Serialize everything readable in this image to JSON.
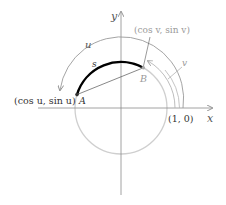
{
  "diagram": {
    "axes": {
      "x_label": "x",
      "y_label": "y",
      "unit_point_label": "(1, 0)"
    },
    "points": {
      "A": {
        "name": "A",
        "coord_label": "(cos u, sin u)"
      },
      "B": {
        "name": "B",
        "coord_label": "(cos v, sin v)"
      }
    },
    "arcs": {
      "s_label": "s",
      "u_label": "u",
      "v_label": "v"
    },
    "colors": {
      "circle": "#c8c8c8",
      "axis": "#8a8a8a",
      "arc_s": "#000000",
      "chord": "#555555",
      "label_gray": "#9a9a9a",
      "label_dark": "#333333"
    }
  }
}
